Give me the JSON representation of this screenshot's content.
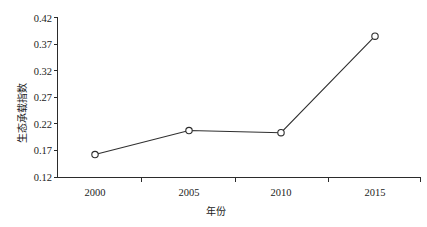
{
  "chart_data": {
    "type": "line",
    "title": "",
    "xlabel": "年份",
    "ylabel": "生态承载指数",
    "categories": [
      "2000",
      "2005",
      "2010",
      "2015"
    ],
    "x": [
      2000,
      2005,
      2010,
      2015
    ],
    "values": [
      0.163,
      0.208,
      0.204,
      0.385
    ],
    "series": [
      {
        "name": "生态承载指数",
        "values": [
          0.163,
          0.208,
          0.204,
          0.385
        ],
        "marker": "open-circle",
        "line_color": "#2f2f2f",
        "marker_fill": "#ffffff"
      }
    ],
    "ylim": [
      0.12,
      0.42
    ],
    "ytick_labels": [
      "0.12",
      "0.17",
      "0.22",
      "0.27",
      "0.32",
      "0.37",
      "0.42"
    ],
    "ytick_values": [
      0.12,
      0.17,
      0.22,
      0.27,
      0.32,
      0.37,
      0.42
    ],
    "xtick_labels": [
      "2000",
      "2005",
      "2010",
      "2015"
    ],
    "grid": false,
    "legend": false,
    "legend_position": "none",
    "annotations": []
  },
  "axes": {
    "y_title": "生态承载指数",
    "x_title": "年份",
    "y_ticks": [
      {
        "label": "0.42"
      },
      {
        "label": "0.37"
      },
      {
        "label": "0.32"
      },
      {
        "label": "0.27"
      },
      {
        "label": "0.22"
      },
      {
        "label": "0.17"
      },
      {
        "label": "0.12"
      }
    ],
    "x_ticks": [
      {
        "label": "2000"
      },
      {
        "label": "2005"
      },
      {
        "label": "2010"
      },
      {
        "label": "2015"
      }
    ]
  }
}
